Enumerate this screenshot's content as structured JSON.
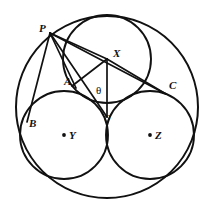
{
  "figure": {
    "background_color": "#ffffff",
    "stroke_color": "#111111",
    "canvas": {
      "width": 213,
      "height": 216
    }
  },
  "circles": [
    {
      "name": "outer-circle",
      "label": "",
      "cx": 107,
      "cy": 107,
      "r": 91,
      "stroke_width": 2.0
    },
    {
      "name": "circle-X",
      "label": "X",
      "cx": 107,
      "cy": 59,
      "r": 44,
      "stroke_width": 1.9
    },
    {
      "name": "circle-Y",
      "label": "Y",
      "cx": 64,
      "cy": 135,
      "r": 44,
      "stroke_width": 1.9
    },
    {
      "name": "circle-Z",
      "label": "Z",
      "cx": 150,
      "cy": 135,
      "r": 44,
      "stroke_width": 1.9
    }
  ],
  "points": [
    {
      "id": "P",
      "label": "P",
      "x": 50,
      "y": 33,
      "label_x": 39,
      "label_y": 23,
      "dot": false
    },
    {
      "id": "X",
      "label": "X",
      "x": 107,
      "y": 59,
      "label_x": 113,
      "label_y": 48,
      "dot": false
    },
    {
      "id": "A",
      "label": "A",
      "x": 76,
      "y": 88,
      "label_x": 64,
      "label_y": 76,
      "dot": false
    },
    {
      "id": "C",
      "label": "C",
      "x": 166,
      "y": 94,
      "label_x": 169,
      "label_y": 80,
      "dot": false
    },
    {
      "id": "B",
      "label": "B",
      "x": 27,
      "y": 122,
      "label_x": 29,
      "label_y": 118,
      "dot": false
    },
    {
      "id": "O",
      "label": "O",
      "x": 107,
      "y": 117,
      "label_x": 104,
      "label_y": 114,
      "dot": false
    },
    {
      "id": "Y",
      "label": "Y",
      "x": 64,
      "y": 135,
      "label_x": 69,
      "label_y": 130,
      "dot": true
    },
    {
      "id": "Z",
      "label": "Z",
      "x": 150,
      "y": 135,
      "label_x": 155,
      "label_y": 130,
      "dot": true
    }
  ],
  "angle": {
    "symbol": "θ",
    "label_x": 96,
    "label_y": 85,
    "vertex": "O",
    "rays": [
      "O-X",
      "O-P"
    ]
  },
  "segments": [
    {
      "name": "segment-P-X",
      "from": "P",
      "to": "X",
      "x1": 50,
      "y1": 33,
      "x2": 107,
      "y2": 59
    },
    {
      "name": "segment-P-C",
      "from": "P",
      "to": "C",
      "x1": 50,
      "y1": 33,
      "x2": 166,
      "y2": 94
    },
    {
      "name": "segment-P-O",
      "from": "P",
      "to": "O",
      "x1": 50,
      "y1": 33,
      "x2": 107,
      "y2": 117
    },
    {
      "name": "segment-P-A",
      "from": "P",
      "to": "A",
      "x1": 50,
      "y1": 33,
      "x2": 76,
      "y2": 88
    },
    {
      "name": "segment-P-B",
      "from": "P",
      "to": "B",
      "x1": 50,
      "y1": 33,
      "x2": 27,
      "y2": 122
    },
    {
      "name": "segment-X-O",
      "from": "X",
      "to": "O",
      "x1": 107,
      "y1": 59,
      "x2": 107,
      "y2": 117
    },
    {
      "name": "segment-X-A",
      "from": "X",
      "to": "A",
      "x1": 107,
      "y1": 59,
      "x2": 72,
      "y2": 86
    },
    {
      "name": "segment-X-C",
      "from": "X",
      "to": "C",
      "x1": 107,
      "y1": 59,
      "x2": 166,
      "y2": 94
    }
  ]
}
